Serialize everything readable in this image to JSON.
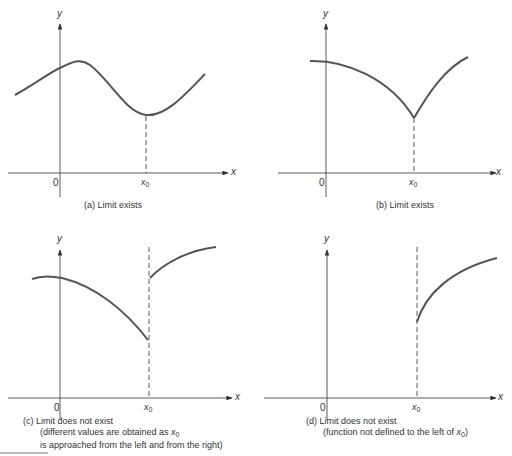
{
  "figure": {
    "panels": [
      {
        "id": "a",
        "caption": "(a)  Limit exists",
        "axis_labels": {
          "x": "x",
          "y": "y",
          "origin": "0",
          "x0": "x",
          "x0_sub": "0"
        }
      },
      {
        "id": "b",
        "caption": "(b)  Limit exists",
        "axis_labels": {
          "x": "x",
          "y": "y",
          "origin": "0",
          "x0": "x",
          "x0_sub": "0"
        }
      },
      {
        "id": "c",
        "caption_line1": "(c)  Limit does not exist",
        "caption_line2": "(different values are obtained as ",
        "caption_line2_var": "x",
        "caption_line2_sub": "0",
        "caption_line3": "is approached from the left and from the right)",
        "axis_labels": {
          "x": "x",
          "y": "y",
          "origin": "0",
          "x0": "x",
          "x0_sub": "0"
        }
      },
      {
        "id": "d",
        "caption_line1": "(d)  Limit does not exist",
        "caption_line2": "(function not defined to the left of ",
        "caption_line2_var": "x",
        "caption_line2_sub": "0",
        "caption_line2_end": ")",
        "axis_labels": {
          "x": "x",
          "y": "y",
          "origin": "0",
          "x0": "x",
          "x0_sub": "0"
        }
      }
    ],
    "colors": {
      "curve": "#555555",
      "axis": "#333333",
      "text": "#333333"
    }
  }
}
